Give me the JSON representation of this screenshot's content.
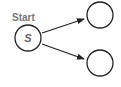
{
  "diagram": {
    "start_label": "Start",
    "nodes": [
      {
        "id": "s",
        "label": "S",
        "cx": 28,
        "cy": 38,
        "r": 14
      },
      {
        "id": "top",
        "label": "",
        "cx": 100,
        "cy": 15,
        "r": 14
      },
      {
        "id": "bottom",
        "label": "",
        "cx": 100,
        "cy": 63,
        "r": 14
      }
    ],
    "edges": [
      {
        "from": "s",
        "to": "top"
      },
      {
        "from": "s",
        "to": "bottom"
      }
    ],
    "colors": {
      "stroke": "#222222",
      "label": "#777777",
      "node_text": "#666666"
    }
  }
}
